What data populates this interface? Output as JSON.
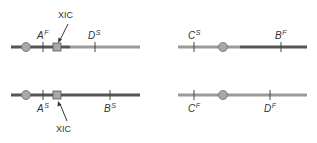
{
  "colors": {
    "dark_line": "#555555",
    "light_line": "#9a9a9a",
    "marker_fill": "#a8a8a8",
    "marker_stroke": "#6a6a6a",
    "text": "#333333"
  },
  "panels": [
    {
      "id": "top-left",
      "labels": [
        {
          "letter": "A",
          "sup": "F"
        },
        {
          "letter": "D",
          "sup": "S"
        }
      ],
      "xic_label": "XIC"
    },
    {
      "id": "top-right",
      "labels": [
        {
          "letter": "C",
          "sup": "S"
        },
        {
          "letter": "B",
          "sup": "F"
        }
      ]
    },
    {
      "id": "bottom-left",
      "labels": [
        {
          "letter": "A",
          "sup": "S"
        },
        {
          "letter": "B",
          "sup": "S"
        }
      ],
      "xic_label": "XIC"
    },
    {
      "id": "bottom-right",
      "labels": [
        {
          "letter": "C",
          "sup": "F"
        },
        {
          "letter": "D",
          "sup": "F"
        }
      ]
    }
  ]
}
